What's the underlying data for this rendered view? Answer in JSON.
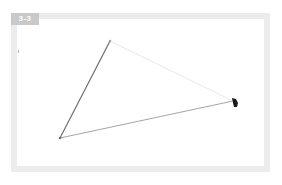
{
  "figure": {
    "label": "3-3",
    "colors": {
      "frame_border": "#ececec",
      "badge_bg": "#c9c9c9",
      "badge_text": "#ffffff",
      "edge_left": "#6e6e6e",
      "edge_bottom": "#9a9a9a",
      "edge_top_right": "#e4e4e4",
      "cursor": "#1a1a1a"
    },
    "triangle": {
      "vertices": [
        {
          "name": "top",
          "x": 110,
          "y": 41
        },
        {
          "name": "bottom-left",
          "x": 60,
          "y": 138
        },
        {
          "name": "right",
          "x": 233,
          "y": 101
        }
      ]
    },
    "cursor": {
      "x": 235,
      "y": 103
    }
  }
}
